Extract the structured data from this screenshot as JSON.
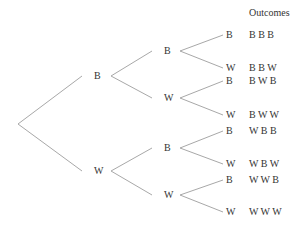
{
  "header": {
    "title": "Outcomes"
  },
  "root": {
    "x": 18,
    "y": 124
  },
  "level1": [
    {
      "label": "B",
      "x": 97,
      "y": 76,
      "lx": 82,
      "rx": 111
    },
    {
      "label": "W",
      "x": 97,
      "y": 171,
      "lx": 82,
      "rx": 111
    }
  ],
  "level2": [
    {
      "label": "B",
      "x": 167,
      "y": 51,
      "lx": 152,
      "rx": 180,
      "parent": 0
    },
    {
      "label": "W",
      "x": 167,
      "y": 98,
      "lx": 152,
      "rx": 180,
      "parent": 0
    },
    {
      "label": "B",
      "x": 167,
      "y": 148,
      "lx": 152,
      "rx": 180,
      "parent": 1
    },
    {
      "label": "W",
      "x": 167,
      "y": 195,
      "lx": 152,
      "rx": 180,
      "parent": 1
    }
  ],
  "leaves": [
    {
      "label": "B",
      "y": 35,
      "parent": 0,
      "outcome": "B B B"
    },
    {
      "label": "W",
      "y": 68,
      "parent": 0,
      "outcome": "B B W"
    },
    {
      "label": "B",
      "y": 81,
      "parent": 1,
      "outcome": "B W B"
    },
    {
      "label": "W",
      "y": 115,
      "parent": 1,
      "outcome": "B W W"
    },
    {
      "label": "B",
      "y": 131,
      "parent": 2,
      "outcome": "W B B"
    },
    {
      "label": "W",
      "y": 164,
      "parent": 2,
      "outcome": "W B W"
    },
    {
      "label": "B",
      "y": 180,
      "parent": 3,
      "outcome": "W W B"
    },
    {
      "label": "W",
      "y": 212,
      "parent": 3,
      "outcome": "W W W"
    }
  ],
  "colors": {
    "line": "#a8a8a8",
    "text": "#333333"
  }
}
